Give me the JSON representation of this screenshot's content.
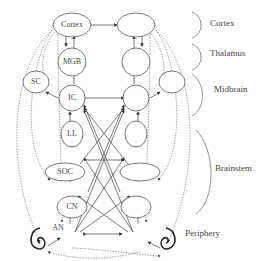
{
  "diagram": {
    "nodes": [
      {
        "id": "cortex_l",
        "label": "Cortex"
      },
      {
        "id": "mgb_l",
        "label": "MGB"
      },
      {
        "id": "sc_l",
        "label": "SC"
      },
      {
        "id": "ic_l",
        "label": "IC"
      },
      {
        "id": "ll_l",
        "label": "LL"
      },
      {
        "id": "soc_l",
        "label": "SOC"
      },
      {
        "id": "cn_l",
        "label": "CN"
      },
      {
        "id": "cortex_r",
        "label": ""
      },
      {
        "id": "mgb_r",
        "label": ""
      },
      {
        "id": "sc_r",
        "label": ""
      },
      {
        "id": "ic_r",
        "label": ""
      },
      {
        "id": "ll_r",
        "label": ""
      },
      {
        "id": "soc_r",
        "label": ""
      },
      {
        "id": "cn_r",
        "label": ""
      }
    ],
    "edge_labels": {
      "an": "AN"
    },
    "regions": [
      {
        "label": "Cortex"
      },
      {
        "label": "Thalamus"
      },
      {
        "label": "Midbrain"
      },
      {
        "label": "Brainstem"
      },
      {
        "label": "Periphery"
      }
    ]
  }
}
